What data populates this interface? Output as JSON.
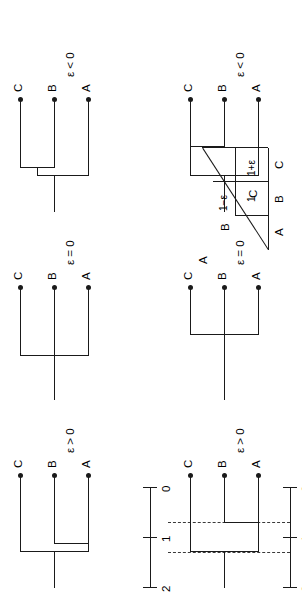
{
  "figure": {
    "taxa": [
      "A",
      "B",
      "C"
    ],
    "epsilon_symbol": "ε",
    "panel_conditions": [
      "ε > 0",
      "ε = 0",
      "ε < 0"
    ]
  },
  "matrix": {
    "caption": "",
    "row_labels": [
      "A",
      "B",
      "C"
    ],
    "col_labels": [
      "A",
      "B",
      "C"
    ],
    "cells": [
      {
        "row": "B",
        "col": "A",
        "value": "1−ε"
      },
      {
        "row": "C",
        "col": "A",
        "value": "1"
      },
      {
        "row": "C",
        "col": "B",
        "value": "1+ε"
      }
    ]
  },
  "scalebars": [
    {
      "id": "scalebar-top",
      "ticks": [
        "2",
        "1",
        "0"
      ],
      "values": [
        2,
        1,
        0
      ]
    },
    {
      "id": "scalebar-bottom",
      "ticks": [
        "2",
        "1",
        "0"
      ],
      "values": [
        2,
        1,
        0
      ]
    }
  ],
  "dashed_guides": {
    "count": 2,
    "values": [
      1.6,
      1.0
    ],
    "color": "#3a3a3a"
  },
  "rows": [
    {
      "id": "row-top",
      "name": "unweighted-pair-group-trees",
      "trees": [
        {
          "id": "tree-top-epsilon-positive",
          "condition": "ε > 0",
          "tips": [
            "A",
            "B",
            "C"
          ],
          "clade": "(A,B),C"
        },
        {
          "id": "tree-top-epsilon-zero",
          "condition": "ε = 0",
          "tips": [
            "A",
            "B",
            "C"
          ],
          "clade": "(A,B,C)"
        },
        {
          "id": "tree-top-epsilon-negative",
          "condition": "ε < 0",
          "tips": [
            "A",
            "B",
            "C"
          ],
          "clade": "A,(B,C)"
        }
      ]
    },
    {
      "id": "row-bottom",
      "name": "scaled-branch-length-trees",
      "trees": [
        {
          "id": "tree-bottom-epsilon-positive",
          "condition": "ε > 0",
          "tips": [
            "A",
            "B",
            "C"
          ],
          "clade": "(A,B),C"
        },
        {
          "id": "tree-bottom-epsilon-zero",
          "condition": "ε = 0",
          "tips": [
            "A",
            "B",
            "C"
          ],
          "clade": "(A,B,C)"
        },
        {
          "id": "tree-bottom-epsilon-negative",
          "condition": "ε < 0",
          "tips": [
            "A",
            "B",
            "C"
          ],
          "clade": "A,(B,C)"
        }
      ]
    }
  ],
  "colors": {
    "ink": "#1a1a1a",
    "dash": "#3a3a3a",
    "paper": "#ffffff"
  }
}
